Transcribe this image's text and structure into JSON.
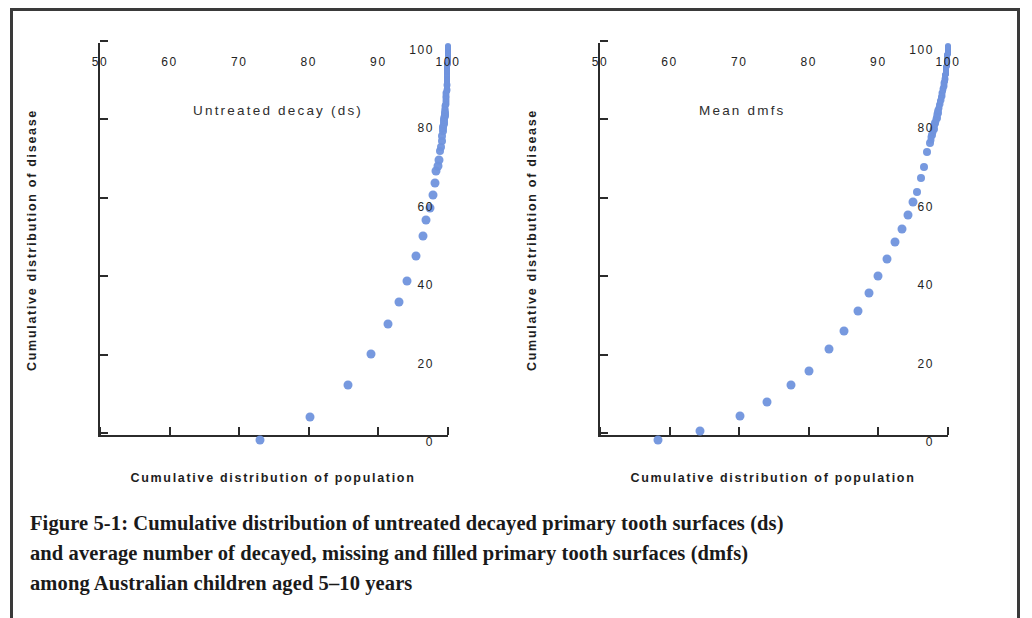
{
  "figure": {
    "caption_lines": [
      "Figure 5-1: Cumulative distribution of untreated decayed primary tooth surfaces (ds)",
      "and average number of decayed, missing and filled primary tooth surfaces (dmfs)",
      "among Australian children aged 5–10 years"
    ],
    "marker_color": "#7094dd",
    "axis_color": "#2b2b2b"
  },
  "chart_data": [
    {
      "type": "scatter",
      "title": "Untreated decay (ds)",
      "xlabel": "Cumulative distribution of population",
      "ylabel": "Cumulative distribution of disease",
      "xlim": [
        50,
        100
      ],
      "ylim": [
        0,
        100
      ],
      "xticks": [
        50,
        60,
        70,
        80,
        90,
        100
      ],
      "yticks": [
        0,
        20,
        40,
        60,
        80,
        100
      ],
      "xticklabels": [
        "50",
        "60",
        "70",
        "80",
        "90",
        "100"
      ],
      "yticklabels": [
        "0",
        "20",
        "40",
        "60",
        "80",
        "100"
      ],
      "grid": false,
      "legend": "none",
      "x": [
        73.0,
        80.2,
        85.7,
        89.0,
        91.4,
        92.9,
        94.1,
        95.4,
        96.4,
        96.9,
        97.4,
        97.8,
        98.1,
        98.3,
        98.5,
        98.7,
        98.85,
        99.0,
        99.1,
        99.2,
        99.3,
        99.35,
        99.4,
        99.45,
        99.5,
        99.55,
        99.6,
        99.63,
        99.66,
        99.69,
        99.72,
        99.75,
        99.78,
        99.8,
        99.82,
        99.84,
        99.86,
        99.88,
        99.9,
        99.92,
        99.94,
        99.96,
        99.98,
        100.0
      ],
      "y": [
        0.0,
        5.8,
        13.9,
        21.7,
        29.4,
        35.2,
        40.5,
        46.9,
        51.8,
        56.0,
        59.0,
        62.4,
        65.4,
        68.4,
        69.8,
        71.3,
        73.6,
        74.4,
        76.1,
        77.4,
        78.7,
        79.6,
        80.6,
        81.4,
        82.3,
        83.1,
        84.0,
        84.7,
        85.4,
        86.1,
        86.8,
        87.5,
        88.2,
        88.9,
        90.2,
        91.2,
        92.2,
        93.1,
        94.0,
        95.0,
        96.0,
        97.1,
        98.5,
        100.0
      ]
    },
    {
      "type": "scatter",
      "title": "Mean dmfs",
      "xlabel": "Cumulative distribution of population",
      "ylabel": "Cumulative distribution of disease",
      "xlim": [
        50,
        100
      ],
      "ylim": [
        0,
        100
      ],
      "xticks": [
        50,
        60,
        70,
        80,
        90,
        100
      ],
      "yticks": [
        0,
        20,
        40,
        60,
        80,
        100
      ],
      "xticklabels": [
        "50",
        "60",
        "70",
        "80",
        "90",
        "100"
      ],
      "yticklabels": [
        "0",
        "20",
        "40",
        "60",
        "80",
        "100"
      ],
      "grid": false,
      "legend": "none",
      "x": [
        58.4,
        64.3,
        70.1,
        74.0,
        77.5,
        80.0,
        82.9,
        85.0,
        87.0,
        88.6,
        90.0,
        91.3,
        92.4,
        93.4,
        94.2,
        95.0,
        95.6,
        96.1,
        96.6,
        97.0,
        97.4,
        97.7,
        97.95,
        98.15,
        98.35,
        98.5,
        98.65,
        98.8,
        98.95,
        99.08,
        99.2,
        99.3,
        99.4,
        99.48,
        99.55,
        99.62,
        99.68,
        99.74,
        99.79,
        99.84,
        99.88,
        99.92,
        99.96,
        100.0
      ],
      "y": [
        0.0,
        2.2,
        6.0,
        9.6,
        13.9,
        17.6,
        23.1,
        27.6,
        32.8,
        37.4,
        41.6,
        46.0,
        50.3,
        53.7,
        57.2,
        60.7,
        63.1,
        66.6,
        69.4,
        73.2,
        75.6,
        77.6,
        79.2,
        80.6,
        81.9,
        83.1,
        84.2,
        85.3,
        86.3,
        87.3,
        88.2,
        89.1,
        90.0,
        90.8,
        91.6,
        92.4,
        93.2,
        94.0,
        94.9,
        95.8,
        96.7,
        97.6,
        98.7,
        100.0
      ]
    }
  ]
}
